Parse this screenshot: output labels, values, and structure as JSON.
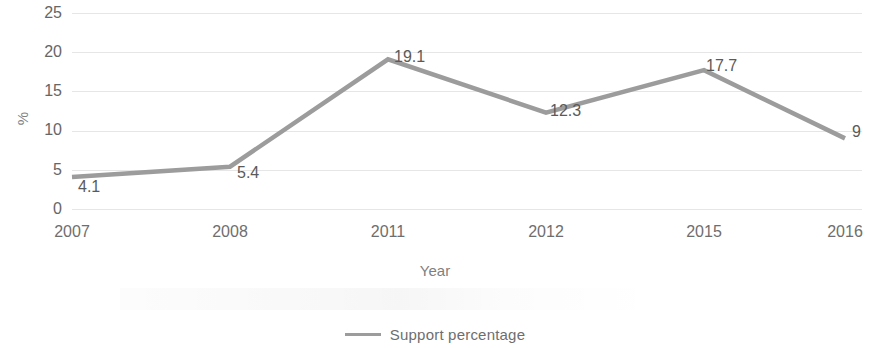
{
  "chart_data": {
    "type": "line",
    "title": "",
    "xlabel": "Year",
    "ylabel": "%",
    "categories": [
      "2007",
      "2008",
      "2011",
      "2012",
      "2015",
      "2016"
    ],
    "values": [
      4.1,
      5.4,
      19.1,
      12.3,
      17.7,
      9
    ],
    "point_labels": [
      "4.1",
      "5.4",
      "19.1",
      "12.3",
      "17.7",
      "9"
    ],
    "series": [
      {
        "name": "Support percentage",
        "values": [
          4.1,
          5.4,
          19.1,
          12.3,
          17.7,
          9
        ]
      }
    ],
    "ylim": [
      0,
      25
    ],
    "y_ticks": [
      "25",
      "20",
      "15",
      "10",
      "5",
      "0"
    ],
    "y_tick_values": [
      25,
      20,
      15,
      10,
      5,
      0
    ],
    "grid": true,
    "legend_position": "bottom",
    "line_color": "#9c9c9c",
    "gridline_color": "#e6e6e6",
    "text_color": "#6e6e6e"
  },
  "axes": {
    "y_title": "%",
    "x_title": "Year"
  },
  "legend": {
    "entries": [
      {
        "label": "Support percentage",
        "color": "#9c9c9c"
      }
    ]
  }
}
